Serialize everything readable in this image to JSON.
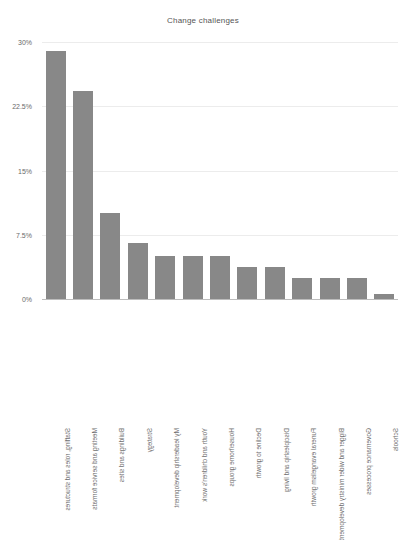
{
  "chart_data": {
    "type": "bar",
    "title": "Change challenges",
    "xlabel": "",
    "ylabel": "",
    "ylim": [
      0,
      30
    ],
    "grid": true,
    "legend": "none",
    "orientation": "vertical",
    "bar_color": "#888888",
    "label_rotation": "180",
    "yticks": [
      "0%",
      "7.5%",
      "15%",
      "22.5%",
      "30%"
    ],
    "ytick_values": [
      0,
      7.5,
      15,
      22.5,
      30
    ],
    "categories": [
      "Staffing, roles and structures",
      "Meeting and service formats",
      "Buildings and sites",
      "Strategy",
      "My leadership development",
      "Youth and children's work",
      "House/home groups",
      "Decline to growth",
      "Discipleship and living",
      "Funeral evangelism growth",
      "Bigger and wider ministry development",
      "Governance processes",
      "Schools"
    ],
    "values": [
      28.9,
      24.3,
      10.0,
      6.5,
      5.0,
      5.0,
      5.0,
      3.7,
      3.7,
      2.5,
      2.5,
      2.5,
      0.6
    ]
  }
}
